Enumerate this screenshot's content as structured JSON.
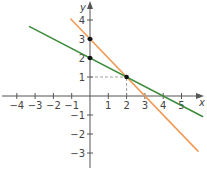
{
  "chart_data": {
    "type": "line",
    "title": "",
    "xlabel": "x",
    "ylabel": "y",
    "xlim": [
      -4.4,
      6.1
    ],
    "ylim": [
      -3.8,
      5.0
    ],
    "grid": false,
    "legend": null,
    "x_ticks": [
      -4,
      -3,
      -2,
      -1,
      1,
      2,
      3,
      4,
      5
    ],
    "y_ticks": [
      -3,
      -2,
      -1,
      1,
      2,
      3,
      4
    ],
    "series": [
      {
        "name": "orange line",
        "equation": "y = -x + 3",
        "color": "#f29a55",
        "x": [
          -1.05,
          5.9
        ],
        "y": [
          4.05,
          -2.9
        ]
      },
      {
        "name": "green line",
        "equation": "y = -0.5x + 2",
        "color": "#3d8b3d",
        "x": [
          -3.3,
          6.15
        ],
        "y": [
          3.65,
          -1.08
        ]
      }
    ],
    "points": [
      {
        "x": 0,
        "y": 3,
        "label": "orange y-intercept"
      },
      {
        "x": 0,
        "y": 2,
        "label": "green y-intercept"
      },
      {
        "x": 2,
        "y": 1,
        "label": "intersection"
      }
    ],
    "guides": [
      {
        "from": [
          0,
          1
        ],
        "to": [
          2,
          1
        ],
        "style": "dashed"
      },
      {
        "from": [
          2,
          0
        ],
        "to": [
          2,
          1
        ],
        "style": "dashed"
      }
    ]
  },
  "labels": {
    "x_axis": "x",
    "y_axis": "y",
    "x_ticks": [
      "−4",
      "−3",
      "−2",
      "−1",
      "1",
      "2",
      "3",
      "4",
      "5"
    ],
    "y_ticks": [
      "4",
      "3",
      "2",
      "1",
      "−1",
      "−2",
      "−3"
    ]
  }
}
